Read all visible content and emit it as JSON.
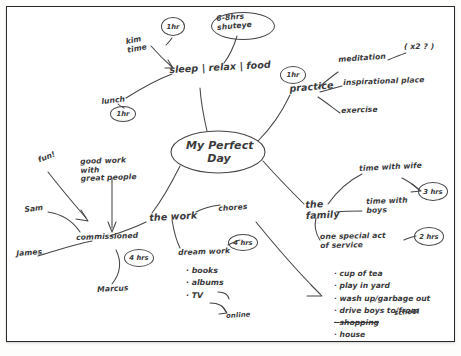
{
  "page": {
    "type": "hand-drawn mind map on white paper",
    "central_node": "My Perfect\nDay"
  },
  "nodes": {
    "sleep": {
      "label": "sleep | relax | food",
      "kim_time": "kim\ntime",
      "shuteye": "6-8hrs\nshuteye",
      "lunch": "lunch",
      "badge_kim": "1hr",
      "badge_lunch": "1hr"
    },
    "practice": {
      "label": "practice",
      "badge": "1hr",
      "children": [
        "meditation",
        "inspirational place",
        "exercise"
      ],
      "annotation": "( x2 ? )"
    },
    "work": {
      "label": "the work",
      "chores": "chores",
      "commissioned": "commissioned",
      "badge_commissioned": "4 hrs",
      "dream_work": "dream work",
      "badge_dream": "4 hrs",
      "dream_items": [
        "books",
        "albums",
        "TV"
      ],
      "online": "online",
      "fun": "fun!",
      "good_people": "good work\nwith\ngreat people",
      "sam": "Sam",
      "james": "James",
      "marcus": "Marcus"
    },
    "family": {
      "label": "the\nfamily",
      "time_with_wife": "time with wife",
      "badge_wife": "3 hrs",
      "time_with_boys": "time with\nboys",
      "service": "one special act\nof service",
      "badge_service": "2 hrs",
      "service_items": [
        {
          "text": "cup of tea",
          "struck": false
        },
        {
          "text": "play in yard",
          "struck": false
        },
        {
          "text": "wash up/garbage out",
          "struck": false
        },
        {
          "text": "drive boys to/from",
          "struck": false
        },
        {
          "text": "shopping",
          "struck": true
        },
        {
          "text": "house",
          "struck": false
        }
      ],
      "school": "school"
    }
  },
  "colors": {
    "ink": "#3a3a3c",
    "paper": "#ffffff",
    "border": "#2a2a2a"
  }
}
